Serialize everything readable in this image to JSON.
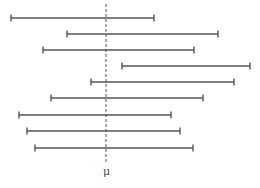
{
  "chart_data": {
    "type": "interval",
    "title": "",
    "reference_line": {
      "label": "μ",
      "x": 106,
      "style": "dashed",
      "y_top": 4,
      "y_bottom": 162
    },
    "intervals": [
      {
        "y": 18,
        "low": 11,
        "high": 154
      },
      {
        "y": 34,
        "low": 67,
        "high": 218
      },
      {
        "y": 50,
        "low": 43,
        "high": 194
      },
      {
        "y": 66,
        "low": 122,
        "high": 250
      },
      {
        "y": 82,
        "low": 91,
        "high": 234
      },
      {
        "y": 98,
        "low": 51,
        "high": 203
      },
      {
        "y": 115,
        "low": 19,
        "high": 171
      },
      {
        "y": 131,
        "low": 27,
        "high": 180
      },
      {
        "y": 148,
        "low": 35,
        "high": 193
      }
    ],
    "colors": {
      "interval": "#555555",
      "reference": "#555555"
    },
    "grid": false,
    "legend": null
  },
  "labels": {
    "mu": "μ"
  }
}
